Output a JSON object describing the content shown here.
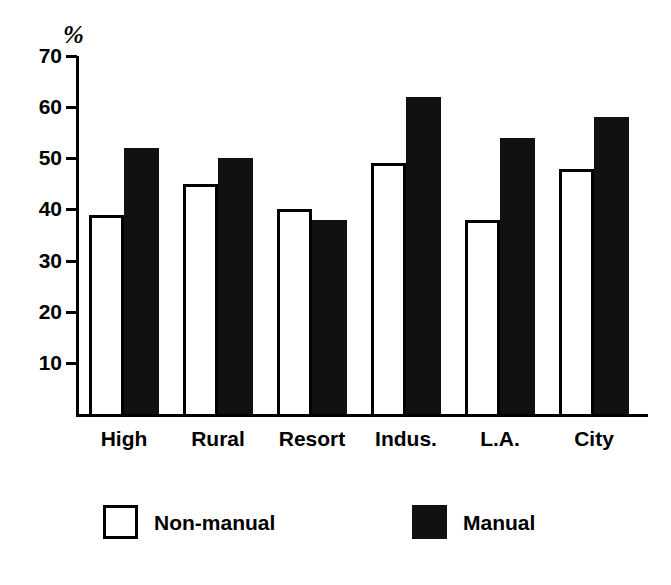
{
  "chart_data": {
    "type": "bar",
    "title": "",
    "subtitle": "",
    "xlabel": "",
    "ylabel": "%",
    "unit_label": "%",
    "categories": [
      "High",
      "Rural",
      "Resort",
      "Indus.",
      "L.A.",
      "City"
    ],
    "series": [
      {
        "name": "Non-manual",
        "values": [
          39,
          45,
          40,
          49,
          38,
          48
        ],
        "style": "open"
      },
      {
        "name": "Manual",
        "values": [
          52,
          50,
          38,
          62,
          54,
          58
        ],
        "style": "filled"
      }
    ],
    "ylim": [
      0,
      70
    ],
    "ytick_labels": [
      "70",
      "60",
      "50",
      "40",
      "30",
      "20",
      "10"
    ],
    "yticks": [
      70,
      60,
      50,
      40,
      30,
      20,
      10
    ],
    "grid": false,
    "legend_position": "bottom",
    "colors": {
      "axis": "#000000",
      "non_manual_fill": "#ffffff",
      "non_manual_stroke": "#000000",
      "manual_fill": "#111111",
      "background": "#ffffff"
    }
  },
  "legend": {
    "items": [
      {
        "label": "Non-manual",
        "style": "open"
      },
      {
        "label": "Manual",
        "style": "filled"
      }
    ]
  }
}
